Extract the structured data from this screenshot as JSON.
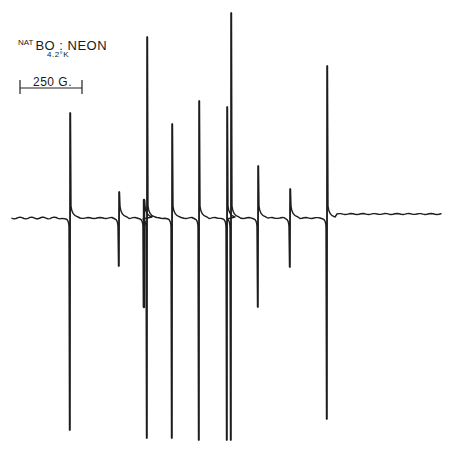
{
  "figure": {
    "title_prefix": "NAT",
    "title_main": "BO : NEON",
    "temperature": "4.2°K",
    "scale_bar_label": "250 G."
  },
  "chart_data": {
    "type": "line",
    "subtitle": "ESR derivative spectrum",
    "xlabel": "Magnetic field",
    "ylabel": "",
    "scale_bar": {
      "label": "250 G.",
      "pixel_length": 63
    },
    "grid": false,
    "legend": null,
    "baseline_y_px": 218,
    "lines": [
      {
        "x_px": 70,
        "top_px": 113,
        "bottom_px": 430
      },
      {
        "x_px": 119,
        "top_px": 192,
        "bottom_px": 266
      },
      {
        "x_px": 144,
        "top_px": 200,
        "bottom_px": 307
      },
      {
        "x_px": 147,
        "top_px": 37,
        "bottom_px": 438
      },
      {
        "x_px": 172,
        "top_px": 124,
        "bottom_px": 438
      },
      {
        "x_px": 199,
        "top_px": 101,
        "bottom_px": 440
      },
      {
        "x_px": 227,
        "top_px": 107,
        "bottom_px": 440
      },
      {
        "x_px": 231,
        "top_px": 13,
        "bottom_px": 440
      },
      {
        "x_px": 258,
        "top_px": 166,
        "bottom_px": 307
      },
      {
        "x_px": 290,
        "top_px": 189,
        "bottom_px": 267
      },
      {
        "x_px": 327,
        "top_px": 66,
        "bottom_px": 419
      }
    ]
  }
}
